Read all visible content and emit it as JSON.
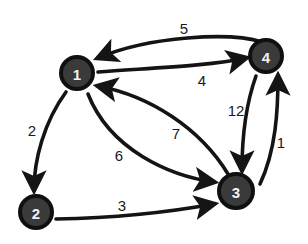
{
  "diagram": {
    "type": "directed weighted graph",
    "nodes": [
      {
        "id": "1",
        "label": "1",
        "x": 77,
        "y": 73
      },
      {
        "id": "2",
        "label": "2",
        "x": 36,
        "y": 212
      },
      {
        "id": "3",
        "label": "3",
        "x": 236,
        "y": 191
      },
      {
        "id": "4",
        "label": "4",
        "x": 266,
        "y": 56
      }
    ],
    "edges": [
      {
        "from": "4",
        "to": "1",
        "weight": "5"
      },
      {
        "from": "1",
        "to": "4",
        "weight": "4"
      },
      {
        "from": "1",
        "to": "2",
        "weight": "2"
      },
      {
        "from": "1",
        "to": "3",
        "weight": "6"
      },
      {
        "from": "3",
        "to": "1",
        "weight": "7"
      },
      {
        "from": "2",
        "to": "3",
        "weight": "3"
      },
      {
        "from": "4",
        "to": "3",
        "weight": "12"
      },
      {
        "from": "3",
        "to": "4",
        "weight": "1"
      }
    ]
  }
}
